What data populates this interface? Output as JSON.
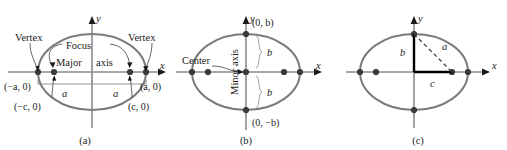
{
  "figure": {
    "kind": "ellipse-anatomy-diagram",
    "panel_count": 3,
    "colors": {
      "background": "#ffffff",
      "ellipse_curve": "#7a7a7a",
      "axis_line": "#8a8a8a",
      "axis_arrow": "#1a1a1a",
      "marker_dot": "#3a3a3a",
      "leader_line": "#555555",
      "dimension_line": "#8a8a8a",
      "text": "#1a1a1a",
      "triangle_leg": "#000000",
      "triangle_hyp_dashed": "#444444"
    }
  },
  "panel_a": {
    "caption": "(a)",
    "axis_x_label": "x",
    "axis_y_label": "y",
    "labels": {
      "vertex_left": "Vertex",
      "vertex_right": "Vertex",
      "focus": "Focus",
      "major_axis_left": "Major",
      "major_axis_right": "axis",
      "coord_minus_a": "(−a, 0)",
      "coord_plus_a": "(a, 0)",
      "coord_minus_c": "(−c, 0)",
      "coord_plus_c": "(c, 0)",
      "dim_a_left": "a",
      "dim_a_right": "a"
    }
  },
  "panel_b": {
    "caption": "(b)",
    "axis_x_label": "x",
    "axis_y_label": "y",
    "labels": {
      "center": "Center",
      "minor_axis": "Minor  axis",
      "coord_plus_b": "(0, b)",
      "coord_minus_b": "(0, −b)",
      "dim_b_upper": "b",
      "dim_b_lower": "b"
    }
  },
  "panel_c": {
    "caption": "(c)",
    "axis_x_label": "x",
    "axis_y_label": "y",
    "labels": {
      "leg_b": "b",
      "leg_c": "c",
      "hypotenuse_a": "a"
    }
  }
}
